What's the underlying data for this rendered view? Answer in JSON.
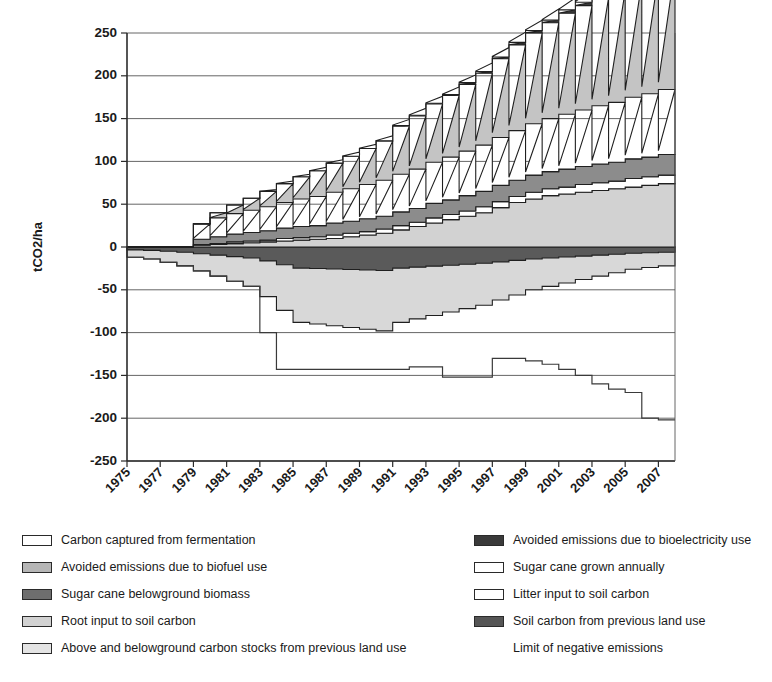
{
  "chart_data": {
    "type": "area",
    "title": "",
    "xlabel": "",
    "ylabel": "tCO2/ha",
    "ylim": [
      -250,
      250
    ],
    "xlim": [
      1975,
      2008
    ],
    "grid": true,
    "legend_position": "below",
    "ytick_labels": [
      "250",
      "200",
      "150",
      "100",
      "50",
      "0",
      "-50",
      "-100",
      "-150",
      "-200",
      "-250"
    ],
    "ytick_values": [
      250,
      200,
      150,
      100,
      50,
      0,
      -50,
      -100,
      -150,
      -200,
      -250
    ],
    "xtick_labels": [
      "1975",
      "1977",
      "1979",
      "1981",
      "1983",
      "1985",
      "1987",
      "1989",
      "1991",
      "1993",
      "1995",
      "1997",
      "1999",
      "2001",
      "2003",
      "2005",
      "2007"
    ],
    "xtick_values": [
      1975,
      1977,
      1979,
      1981,
      1983,
      1985,
      1987,
      1989,
      1991,
      1993,
      1995,
      1997,
      1999,
      2001,
      2003,
      2005,
      2007
    ],
    "x": [
      1975,
      1976,
      1977,
      1978,
      1979,
      1980,
      1981,
      1982,
      1983,
      1984,
      1985,
      1986,
      1987,
      1988,
      1989,
      1990,
      1991,
      1992,
      1993,
      1994,
      1995,
      1996,
      1997,
      1998,
      1999,
      2000,
      2001,
      2002,
      2003,
      2004,
      2005,
      2006,
      2007
    ],
    "series": [
      {
        "name": "Carbon captured from fermentation",
        "color": "#ffffff",
        "values": [
          0,
          0,
          0,
          0,
          0,
          0,
          0,
          0,
          2,
          3,
          3,
          4,
          4,
          5,
          5,
          6,
          7,
          8,
          8,
          9,
          9,
          10,
          11,
          12,
          12,
          13,
          14,
          14,
          15,
          15,
          16,
          16,
          17
        ]
      },
      {
        "name": "Avoided emissions due to bioelectricity use",
        "color": "#3a3a3a",
        "values": [
          0,
          0,
          0,
          0,
          0,
          0,
          0,
          0,
          0,
          0,
          0,
          0,
          0,
          0,
          0,
          0,
          1,
          1,
          1,
          1,
          2,
          2,
          2,
          3,
          3,
          3,
          4,
          4,
          4,
          5,
          5,
          5,
          6
        ]
      },
      {
        "name": "Avoided emissions due to biofuel use",
        "color": "#c4c4c4",
        "values": [
          0,
          0,
          0,
          0,
          0,
          6,
          10,
          14,
          18,
          22,
          26,
          30,
          34,
          38,
          42,
          46,
          56,
          62,
          68,
          72,
          78,
          84,
          92,
          100,
          106,
          112,
          118,
          122,
          126,
          130,
          134,
          138,
          142
        ]
      },
      {
        "name": "Sugar cane grown annually",
        "color": "#ffffff",
        "values": [
          0,
          0,
          0,
          0,
          18,
          22,
          24,
          26,
          28,
          30,
          32,
          34,
          36,
          38,
          40,
          42,
          44,
          46,
          48,
          50,
          52,
          54,
          56,
          58,
          60,
          62,
          64,
          66,
          68,
          70,
          72,
          74,
          76
        ]
      },
      {
        "name": "Sugar cane belowground biomass",
        "color": "#8c8c8c",
        "values": [
          0,
          0,
          0,
          0,
          6,
          8,
          9,
          10,
          11,
          12,
          13,
          13,
          14,
          14,
          15,
          15,
          16,
          16,
          17,
          17,
          18,
          18,
          19,
          19,
          20,
          20,
          21,
          21,
          22,
          22,
          23,
          23,
          24
        ]
      },
      {
        "name": "Litter input to soil carbon",
        "color": "#ffffff",
        "values": [
          0,
          0,
          0,
          0,
          1,
          1,
          2,
          2,
          2,
          3,
          3,
          3,
          4,
          4,
          4,
          5,
          5,
          5,
          6,
          6,
          6,
          7,
          7,
          7,
          8,
          8,
          8,
          9,
          9,
          9,
          10,
          10,
          10
        ]
      },
      {
        "name": "Root input to soil carbon",
        "color": "#d2d2d2",
        "values": [
          0,
          0,
          0,
          0,
          2,
          3,
          4,
          5,
          6,
          7,
          8,
          9,
          10,
          12,
          14,
          16,
          20,
          24,
          28,
          32,
          36,
          40,
          46,
          52,
          56,
          60,
          62,
          64,
          66,
          68,
          70,
          72,
          74
        ]
      },
      {
        "name": "Soil carbon from previous land use",
        "color": "#5a5a5a",
        "values": [
          -12,
          -14,
          -18,
          -22,
          -28,
          -34,
          -40,
          -46,
          -58,
          -74,
          -88,
          -90,
          -92,
          -94,
          -96,
          -98,
          -88,
          -84,
          -80,
          -76,
          -72,
          -68,
          -62,
          -56,
          -50,
          -46,
          -42,
          -38,
          -34,
          -30,
          -26,
          -24,
          -22
        ]
      },
      {
        "name": "Above and belowground carbon stocks from previous land use",
        "color": "#d8d8d8",
        "values": [
          -12,
          -14,
          -18,
          -22,
          -28,
          -34,
          -40,
          -46,
          -58,
          -74,
          -88,
          -90,
          -92,
          -94,
          -96,
          -98,
          -88,
          -84,
          -80,
          -76,
          -72,
          -68,
          -62,
          -56,
          -50,
          -46,
          -42,
          -38,
          -34,
          -30,
          -26,
          -24,
          -22
        ]
      },
      {
        "name": "Limit of negative emissions",
        "color": "#3a3a3a",
        "values": [
          -12,
          -14,
          -18,
          -22,
          -28,
          -34,
          -40,
          -46,
          -100,
          -143,
          -143,
          -143,
          -143,
          -143,
          -143,
          -143,
          -143,
          -140,
          -140,
          -152,
          -152,
          -152,
          -130,
          -130,
          -133,
          -137,
          -143,
          -150,
          -160,
          -166,
          -170,
          -200,
          -202
        ]
      }
    ]
  },
  "legend": {
    "left_column": [
      {
        "label": "Carbon captured from fermentation",
        "swatch": "#ffffff"
      },
      {
        "label": "Avoided emissions due to biofuel use",
        "swatch": "#b6b6b6"
      },
      {
        "label": "Sugar cane  belowground biomass",
        "swatch": "#6e6e6e"
      },
      {
        "label": "Root input to soil carbon",
        "swatch": "#d2d2d2"
      },
      {
        "label": "Above and belowground carbon stocks from previous land use",
        "swatch": "#e4e4e4"
      }
    ],
    "right_column": [
      {
        "label": "Avoided emissions due to bioelectricity use",
        "swatch": "#3a3a3a"
      },
      {
        "label": "Sugar cane  grown annually",
        "swatch": "#ffffff"
      },
      {
        "label": "Litter input to soil carbon",
        "swatch": "#ffffff"
      },
      {
        "label": "Soil carbon from previous land use",
        "swatch": "#555555"
      },
      {
        "label": "Limit of negative emissions",
        "swatch": null
      }
    ]
  },
  "caption": ""
}
